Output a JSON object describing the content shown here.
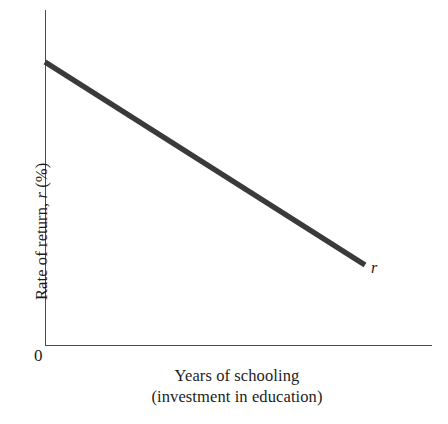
{
  "figure": {
    "background_color": "#ffffff",
    "axis_color": "#4a4a4a",
    "curve_color": "#3a3a3a",
    "text_color": "#1c1c1c"
  },
  "axes": {
    "origin_label": "0",
    "y_title_prefix": "Rate of return, ",
    "y_title_symbol": "r",
    "y_title_suffix": " (%)",
    "y_title_full": "Rate of return, r (%)",
    "x_title_line1": "Years of schooling",
    "x_title_line2": "(investment in education)"
  },
  "annotations": {
    "curve_label": "r"
  },
  "chart_data": {
    "type": "line",
    "title": "",
    "subtitle": "",
    "xlabel": "Years of schooling (investment in education)",
    "ylabel": "Rate of return, r (%)",
    "xlim": [
      0,
      100
    ],
    "ylim": [
      0,
      100
    ],
    "grid": false,
    "legend": "none",
    "axis_tick_labels": {
      "x": [],
      "y": []
    },
    "origin_tick_label": "0",
    "series": [
      {
        "name": "r",
        "label": "r",
        "description": "Declining marginal rate of return to schooling",
        "color": "#3a3a3a",
        "line_width_px": 5.5,
        "x": [
          0,
          100
        ],
        "y": [
          88,
          24
        ],
        "points_px": [
          {
            "x": 45,
            "y": 62
          },
          {
            "x": 365,
            "y": 265
          }
        ],
        "slope": "negative",
        "annotation": {
          "text": "r",
          "x_px": 375,
          "y_px": 272
        }
      }
    ],
    "axis_geometry_px": {
      "y_axis_x": 45,
      "y_axis_top": 10,
      "y_axis_bottom": 345,
      "x_axis_y": 345,
      "x_axis_left": 45,
      "x_axis_right": 432
    }
  }
}
